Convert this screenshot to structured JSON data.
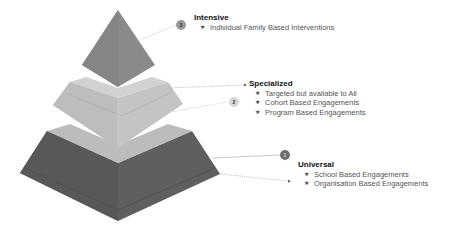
{
  "tiers": [
    {
      "level": 3,
      "title": "Intensive",
      "badge": "3",
      "badge_color": "#9a9a9a",
      "fill": "#8a8a8a",
      "items": [
        "Individual Family Based Interventions"
      ]
    },
    {
      "level": 2,
      "title": "Specialized",
      "badge": "2",
      "badge_color": "#d6d6d6",
      "fill": "#c4c4c4",
      "items": [
        "Targeted but available to All",
        "Cohort Based Engagements",
        "Program Based Engagements"
      ]
    },
    {
      "level": 1,
      "title": "Universal",
      "badge": "1",
      "badge_color": "#6e6e6e",
      "fill": "#5f5f5f",
      "items": [
        "School Based Engagements",
        "Organisation Based Engagements"
      ]
    }
  ],
  "bullet_glyph": "★"
}
